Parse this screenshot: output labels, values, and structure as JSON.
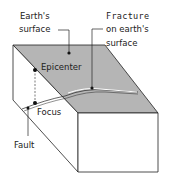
{
  "diagram": {
    "type": "earthquake-block-diagram",
    "colors": {
      "surface": "#b5b5b5",
      "outline": "#222222",
      "background": "#ffffff"
    },
    "labels": {
      "earths_surface_line1": "Earth's",
      "earths_surface_line2": "surface",
      "fracture_line1": "Fracture",
      "fracture_line2": "on earth's",
      "fracture_line3": "surface",
      "epicenter": "Epicenter",
      "focus": "Focus",
      "fault": "Fault"
    }
  }
}
